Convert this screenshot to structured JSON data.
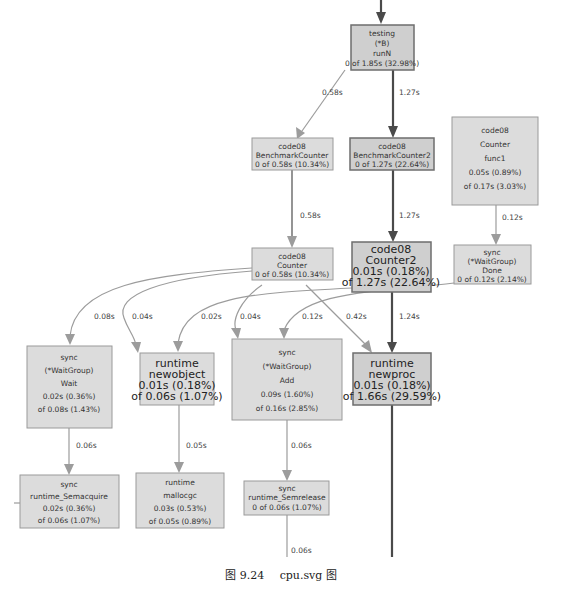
{
  "figure": {
    "caption_number": "图 9.24",
    "caption_text": "cpu.svg 图"
  },
  "nodes": {
    "runN": {
      "lines": [
        "testing",
        "(*B)",
        "runN",
        "0 of 1.85s (32.98%)"
      ]
    },
    "benchmarkCounter": {
      "lines": [
        "code08",
        "BenchmarkCounter",
        "0 of 0.58s (10.34%)"
      ]
    },
    "benchmarkCounter2": {
      "lines": [
        "code08",
        "BenchmarkCounter2",
        "0 of 1.27s (22.64%)"
      ]
    },
    "counterFunc1": {
      "lines": [
        "code08",
        "Counter",
        "func1",
        "0.05s (0.89%)",
        "of 0.17s (3.03%)"
      ]
    },
    "counter": {
      "lines": [
        "code08",
        "Counter",
        "0 of 0.58s (10.34%)"
      ]
    },
    "counter2": {
      "lines": [
        "code08",
        "Counter2",
        "0.01s (0.18%)",
        "of 1.27s (22.64%)"
      ]
    },
    "done": {
      "lines": [
        "sync",
        "(*WaitGroup)",
        "Done",
        "0 of 0.12s (2.14%)"
      ]
    },
    "wait": {
      "lines": [
        "sync",
        "(*WaitGroup)",
        "Wait",
        "0.02s (0.36%)",
        "of 0.08s (1.43%)"
      ]
    },
    "newobject": {
      "lines": [
        "runtime",
        "newobject",
        "0.01s (0.18%)",
        "of 0.06s (1.07%)"
      ]
    },
    "add": {
      "lines": [
        "sync",
        "(*WaitGroup)",
        "Add",
        "0.09s (1.60%)",
        "of 0.16s (2.85%)"
      ]
    },
    "newproc": {
      "lines": [
        "runtime",
        "newproc",
        "0.01s (0.18%)",
        "of 1.66s (29.59%)"
      ]
    },
    "semacquire": {
      "lines": [
        "sync",
        "runtime_Semacquire",
        "0.02s (0.36%)",
        "of 0.06s (1.07%)"
      ]
    },
    "mallocgc": {
      "lines": [
        "runtime",
        "mallocgc",
        "0.03s (0.53%)",
        "of 0.05s (0.89%)"
      ]
    },
    "semrelease": {
      "lines": [
        "sync",
        "runtime_Semrelease",
        "0 of 0.06s (1.07%)"
      ]
    }
  },
  "edges": {
    "runN_to_benchmarkCounter": "0.58s",
    "runN_to_benchmarkCounter2": "1.27s",
    "benchmarkCounter_to_counter": "0.58s",
    "benchmarkCounter2_to_counter2": "1.27s",
    "func1_to_done": "0.12s",
    "counter_to_wait": "0.08s",
    "counter_to_newobject": "0.04s",
    "counter2_to_newobject": "0.02s",
    "counter_to_add": "0.04s",
    "done_to_add": "0.12s",
    "counter_to_newproc": "0.42s",
    "counter2_to_newproc": "1.24s",
    "wait_to_semacquire": "0.06s",
    "newobject_to_mallocgc": "0.05s",
    "add_to_semrelease": "0.06s",
    "semrelease_out": "0.06s"
  }
}
